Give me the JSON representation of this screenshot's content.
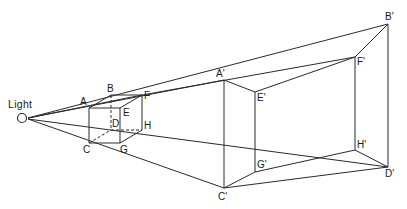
{
  "diagram": {
    "type": "shadow-projection",
    "light": {
      "label": "Light",
      "x": 22,
      "y": 118
    },
    "cube": {
      "A": {
        "label": "A",
        "x": 89,
        "y": 108
      },
      "B": {
        "label": "B",
        "x": 111,
        "y": 95
      },
      "E": {
        "label": "E",
        "x": 120,
        "y": 108
      },
      "F": {
        "label": "F",
        "x": 142,
        "y": 95
      },
      "C": {
        "label": "C",
        "x": 89,
        "y": 143
      },
      "D": {
        "label": "D",
        "x": 111,
        "y": 130
      },
      "G": {
        "label": "G",
        "x": 120,
        "y": 143
      },
      "H": {
        "label": "H",
        "x": 142,
        "y": 130
      }
    },
    "shadow": {
      "A": {
        "label": "A'",
        "x": 224,
        "y": 80
      },
      "B": {
        "label": "B'",
        "x": 388,
        "y": 24
      },
      "E": {
        "label": "E'",
        "x": 255,
        "y": 92
      },
      "F": {
        "label": "F'",
        "x": 355,
        "y": 57
      },
      "C": {
        "label": "C'",
        "x": 224,
        "y": 188
      },
      "D": {
        "label": "D'",
        "x": 388,
        "y": 167
      },
      "G": {
        "label": "G'",
        "x": 255,
        "y": 172
      },
      "H": {
        "label": "H'",
        "x": 355,
        "y": 150
      }
    },
    "line_color": "#2a2a2a"
  }
}
